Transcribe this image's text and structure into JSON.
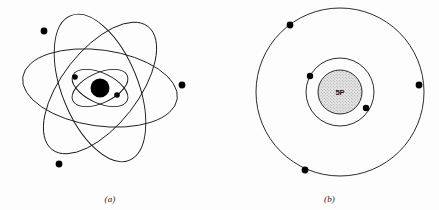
{
  "figure": {
    "background_color": "#fdfdfd",
    "ink_color": "#141414",
    "electron_color": "#000000"
  },
  "panels": [
    {
      "id": "a",
      "caption": "(a)",
      "model_name": "planetary-orbital-model",
      "nucleus": {
        "label": "",
        "style": "solid-black-disc",
        "cx": 100,
        "cy": 88,
        "r": 9.5
      },
      "orbits": [
        {
          "name": "outer-ellipse-1",
          "cx": 100,
          "cy": 88,
          "rx": 78,
          "ry": 38,
          "rotation": 8
        },
        {
          "name": "outer-ellipse-2",
          "cx": 100,
          "cy": 88,
          "rx": 78,
          "ry": 38,
          "rotation": 68
        },
        {
          "name": "outer-ellipse-3",
          "cx": 100,
          "cy": 88,
          "rx": 78,
          "ry": 38,
          "rotation": 128
        },
        {
          "name": "inner-ellipse-1",
          "cx": 100,
          "cy": 88,
          "rx": 30,
          "ry": 15,
          "rotation": 25
        },
        {
          "name": "inner-ellipse-2",
          "cx": 100,
          "cy": 88,
          "rx": 30,
          "ry": 15,
          "rotation": 155
        }
      ],
      "electrons": [
        {
          "name": "electron-outer-upper-left",
          "cx": 44,
          "cy": 31,
          "r": 3.4
        },
        {
          "name": "electron-outer-right",
          "cx": 182,
          "cy": 85,
          "r": 3.4
        },
        {
          "name": "electron-outer-lower-left",
          "cx": 59,
          "cy": 164,
          "r": 3.4
        },
        {
          "name": "electron-inner-left",
          "cx": 75,
          "cy": 77,
          "r": 2.8
        },
        {
          "name": "electron-inner-right",
          "cx": 117,
          "cy": 95,
          "r": 2.8
        }
      ],
      "electron_count": 5
    },
    {
      "id": "b",
      "caption": "(b)",
      "model_name": "bohr-shell-model",
      "nucleus": {
        "label": "5P",
        "style": "stippled-gray-disc",
        "cx": 120,
        "cy": 92,
        "r": 22
      },
      "shells": [
        {
          "name": "inner-shell",
          "cx": 120,
          "cy": 92,
          "r": 34
        },
        {
          "name": "outer-shell",
          "cx": 120,
          "cy": 92,
          "r": 84
        }
      ],
      "electrons": [
        {
          "name": "electron-inner-upper-left",
          "cx": 90,
          "cy": 76,
          "r": 3.2,
          "shell": "inner-shell"
        },
        {
          "name": "electron-inner-lower-right",
          "cx": 146,
          "cy": 108,
          "r": 3.2,
          "shell": "inner-shell"
        },
        {
          "name": "electron-outer-upper-left",
          "cx": 70,
          "cy": 25,
          "r": 3.4,
          "shell": "outer-shell"
        },
        {
          "name": "electron-outer-right",
          "cx": 199,
          "cy": 85,
          "r": 3.4,
          "shell": "outer-shell"
        },
        {
          "name": "electron-outer-bottom-left",
          "cx": 85,
          "cy": 170,
          "r": 3.4,
          "shell": "outer-shell"
        }
      ],
      "electron_count": 5,
      "inner_shell_count": 2,
      "outer_shell_count": 3
    }
  ]
}
